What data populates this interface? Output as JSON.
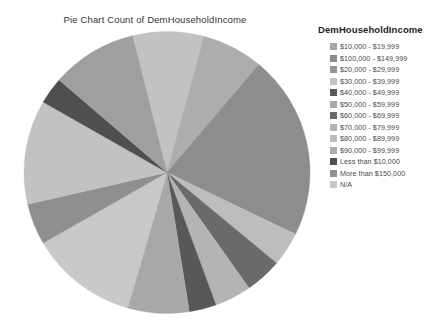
{
  "chart_data": {
    "type": "pie",
    "title": "Pie Chart Count of DemHouseholdIncome",
    "legend_title": "DemHouseholdIncome",
    "legend_position": "right",
    "xlabel": "",
    "ylabel": "",
    "categories": [
      "$10,000 - $19,999",
      "$100,000 - $149,999",
      "$20,000 - $29,999",
      "$30,000 - $39,999",
      "$40,000 - $49,999",
      "$50,000 - $59,999",
      "$60,000 - $69,999",
      "$70,000 - $79,999",
      "$80,000 - $89,999",
      "$90,000 - $99,999",
      "Less than $10,000",
      "More than $150,000",
      "N/A"
    ],
    "values": [
      9.5,
      21.0,
      11.0,
      8.0,
      2.0,
      5.5,
      3.5,
      6.5,
      4.0,
      7.0,
      2.5,
      4.0,
      15.5
    ],
    "colors": [
      "#9f9f9f",
      "#8a8a8a",
      "#949494",
      "#c0c0c0",
      "#585858",
      "#a8a8a8",
      "#6a6a6a",
      "#b4b4b4",
      "#bdbdbd",
      "#adadad",
      "#4f4f4f",
      "#8f8f8f",
      "#cacaca"
    ],
    "slices": [
      {
        "label": "$30,000 - $39,999",
        "start_angle": -14,
        "end_angle": 15,
        "color": "#c2c2c2"
      },
      {
        "label": "$90,000 - $99,999",
        "start_angle": 15,
        "end_angle": 40,
        "color": "#adadad"
      },
      {
        "label": "$100,000 - $149,999",
        "start_angle": 40,
        "end_angle": 116,
        "color": "#8d8d8d"
      },
      {
        "label": "$80,000 - $89,999",
        "start_angle": 116,
        "end_angle": 130,
        "color": "#bdbdbd"
      },
      {
        "label": "$60,000 - $69,999",
        "start_angle": 130,
        "end_angle": 145,
        "color": "#6a6a6a"
      },
      {
        "label": "$70,000 - $79,999",
        "start_angle": 145,
        "end_angle": 160,
        "color": "#b4b4b4"
      },
      {
        "label": "$40,000 - $49,999",
        "start_angle": 160,
        "end_angle": 171,
        "color": "#585858"
      },
      {
        "label": "$50,000 - $59,999",
        "start_angle": 171,
        "end_angle": 196,
        "color": "#a8a8a8"
      },
      {
        "label": "N/A",
        "start_angle": 196,
        "end_angle": 240,
        "color": "#c8c8c8"
      },
      {
        "label": "More than $150,000",
        "start_angle": 240,
        "end_angle": 257,
        "color": "#8f8f8f"
      },
      {
        "label": "$20,000 - $29,999",
        "start_angle": 257,
        "end_angle": 300,
        "color": "#c2c2c2"
      },
      {
        "label": "Less than $10,000",
        "start_angle": 300,
        "end_angle": 311,
        "color": "#4f4f4f"
      },
      {
        "label": "$10,000 - $19,999",
        "start_angle": 311,
        "end_angle": 346,
        "color": "#9f9f9f"
      }
    ]
  },
  "legend": {
    "title": "DemHouseholdIncome",
    "items": [
      {
        "label": "$10,000 - $19,999",
        "color": "#a6a6a6"
      },
      {
        "label": "$100,000 - $149,999",
        "color": "#8d8d8d"
      },
      {
        "label": "$20,000 - $29,999",
        "color": "#949494"
      },
      {
        "label": "$30,000 - $39,999",
        "color": "#c2c2c2"
      },
      {
        "label": "$40,000 - $49,999",
        "color": "#585858"
      },
      {
        "label": "$50,000 - $59,999",
        "color": "#a8a8a8"
      },
      {
        "label": "$60,000 - $69,999",
        "color": "#6a6a6a"
      },
      {
        "label": "$70,000 - $79,999",
        "color": "#b4b4b4"
      },
      {
        "label": "$80,000 - $89,999",
        "color": "#bdbdbd"
      },
      {
        "label": "$90,000 - $99,999",
        "color": "#adadad"
      },
      {
        "label": "Less than $10,000",
        "color": "#4f4f4f"
      },
      {
        "label": "More than $150,000",
        "color": "#8f8f8f"
      },
      {
        "label": "N/A",
        "color": "#c8c8c8"
      }
    ]
  }
}
